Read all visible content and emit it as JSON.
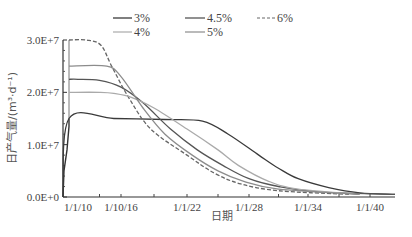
{
  "chart_data": {
    "type": "line",
    "title": "",
    "xlabel": "日期",
    "ylabel": "日产气量/(m³·d⁻¹)",
    "x_tick_labels": [
      "1/1/10",
      "1/10/16",
      "1/1/22",
      "1/1/28",
      "1/1/34",
      "1/1/40"
    ],
    "x_tick_years": [
      2010,
      2016,
      2022,
      2028,
      2034,
      2040
    ],
    "y_tick_labels": [
      "0.0E+0",
      "1.0E+7",
      "2.0E+7",
      "3.0E+7"
    ],
    "y_tick_values": [
      0,
      10000000,
      20000000,
      30000000
    ],
    "xlim": [
      2008.5,
      2041.4
    ],
    "ylim": [
      0,
      30000000
    ],
    "grid": false,
    "legend_position": "top",
    "series": [
      {
        "name": "3%",
        "color": "#3a3a3a",
        "dash": "",
        "x": [
          2008.5,
          2009.1,
          2015,
          2020,
          2023.5,
          2026,
          2029,
          2031,
          2033,
          2036,
          2039,
          2041.4
        ],
        "values": [
          0,
          15000000,
          15000000,
          14800000,
          14500000,
          12000000,
          8000000,
          5500000,
          3500000,
          1800000,
          800000,
          500000
        ]
      },
      {
        "name": "4.5%",
        "color": "#555555",
        "dash": "",
        "x": [
          2009.1,
          2010,
          2013,
          2016,
          2018,
          2020.5,
          2023,
          2025.5,
          2028,
          2031,
          2035,
          2041.4
        ],
        "values": [
          22500000,
          22500000,
          22300000,
          21000000,
          18000000,
          13000000,
          9000000,
          6000000,
          3500000,
          2000000,
          1000000,
          500000
        ]
      },
      {
        "name": "6%",
        "color": "#666666",
        "dash": "4,2",
        "x": [
          2009.1,
          2011.2,
          2013.2,
          2014.7,
          2016.7,
          2018.7,
          2022,
          2024.7,
          2027.2,
          2031,
          2038
        ],
        "values": [
          30000000,
          30000000,
          29000000,
          25000000,
          19000000,
          13000000,
          8000000,
          4500000,
          2500000,
          1200000,
          500000
        ]
      },
      {
        "name": "4%",
        "color": "#aaaaaa",
        "dash": "",
        "x": [
          2009.1,
          2013,
          2015,
          2017,
          2019,
          2022,
          2025,
          2027,
          2030,
          2033,
          2039
        ],
        "values": [
          20000000,
          20000000,
          19800000,
          19000000,
          17000000,
          13000000,
          9000000,
          6000000,
          3000000,
          1500000,
          500000
        ]
      },
      {
        "name": "5%",
        "color": "#8c8c8c",
        "dash": "",
        "x": [
          2009.1,
          2014,
          2016,
          2018,
          2020,
          2022.5,
          2025,
          2027.5,
          2031,
          2039
        ],
        "values": [
          25000000,
          25000000,
          23000000,
          17000000,
          12000000,
          8000000,
          5000000,
          3000000,
          1500000,
          500000
        ]
      }
    ]
  },
  "legend": {
    "row1": [
      "3%",
      "4.5%",
      "6%"
    ],
    "row2": [
      "4%",
      "5%"
    ]
  }
}
